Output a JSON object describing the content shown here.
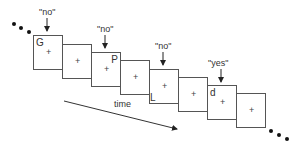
{
  "diagram": {
    "type": "rsvp-frame-sequence",
    "frames": [
      {
        "index": 1,
        "letter": "G",
        "letter_pos": "top-left",
        "fixation": "+",
        "response": "\"no\""
      },
      {
        "index": 2,
        "letter": "",
        "fixation": "+",
        "response": ""
      },
      {
        "index": 3,
        "letter": "P",
        "letter_pos": "top-right",
        "fixation": "+",
        "response": "\"no\""
      },
      {
        "index": 4,
        "letter": "",
        "fixation": "+",
        "response": ""
      },
      {
        "index": 5,
        "letter": "L",
        "letter_pos": "bottom-left",
        "fixation": "+",
        "response": "\"no\""
      },
      {
        "index": 6,
        "letter": "",
        "fixation": "+",
        "response": ""
      },
      {
        "index": 7,
        "letter": "d",
        "letter_pos": "top-left",
        "fixation": "+",
        "response": "\"yes\""
      },
      {
        "index": 8,
        "letter": "",
        "fixation": "+",
        "response": ""
      }
    ],
    "time_label": "time",
    "continuation": "•••"
  }
}
